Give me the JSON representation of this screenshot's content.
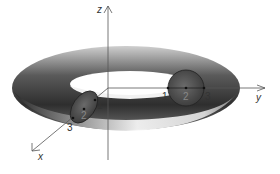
{
  "figure": {
    "axes": {
      "z_label": "z",
      "y_label": "y",
      "x_label": "x"
    },
    "cross_section_y": {
      "inner_label": "1",
      "center_label": "2",
      "outer_label": "3"
    },
    "cross_section_x": {
      "inner_label": "1",
      "center_label": "2",
      "outer_label": "3"
    },
    "colors": {
      "torus_dark": "#3a3a3a",
      "torus_light": "#f0f0f0",
      "cross_section_fill": "#5a5a5a",
      "axis_line": "#555555"
    }
  }
}
